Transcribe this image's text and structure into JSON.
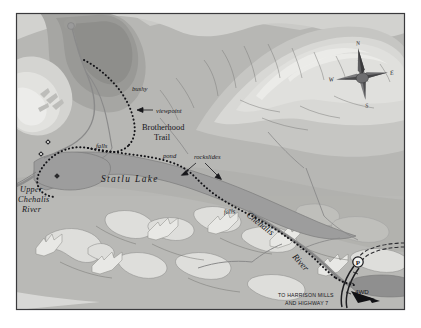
{
  "map": {
    "title": "Statlu Lake and Chehalis River Trail Map",
    "frame": {
      "border_color": "#3a3a3c",
      "background_color": "#ffffff"
    },
    "palette": {
      "paper": "#fbfbfa",
      "terrain_base": "#b4b4b2",
      "terrain_light": "#d6d6d3",
      "terrain_lighter": "#e4e4e1",
      "terrain_mid": "#c2c2bf",
      "terrain_dark": "#9a9a98",
      "terrain_darker": "#8a8a88",
      "water": "#9c9c9c",
      "water_dark": "#8e8e8e",
      "ink": "#16161a",
      "trail_dot": "#141418",
      "road": "#2c2c30"
    },
    "water_features": [
      {
        "name": "Statlu Lake",
        "label": "Statlu  Lake",
        "type": "lake"
      },
      {
        "name": "Upper Chehalis River",
        "label": "Upper\nChehalis\nRiver",
        "type": "river"
      },
      {
        "name": "Chehalis River",
        "label": "Chehalis River",
        "type": "river"
      }
    ],
    "labels": {
      "upper_chehalis_river": [
        "Upper",
        "Chehalis",
        "River"
      ],
      "statlu_lake": "Statlu  Lake",
      "chehalis": "Chehalis",
      "river": "River",
      "brotherhood_trail": [
        "Brotherhood",
        "Trail"
      ],
      "bushy": "bushy",
      "viewpoint": "viewpoint",
      "falls_upper": "falls",
      "falls_lower": "falls",
      "pond": "pond",
      "rockslides": "rockslides",
      "four_wd": "4WD",
      "to_highway": [
        "TO HARRISON MILLS",
        "AND HIGHWAY 7"
      ]
    },
    "compass": {
      "north": "N",
      "south": "S",
      "east": "E",
      "west": "W"
    },
    "markers": {
      "parking": "P",
      "parking_name": "parking-area"
    },
    "trail": {
      "name": "Brotherhood Trail",
      "style": "dotted",
      "color": "#141418"
    }
  }
}
